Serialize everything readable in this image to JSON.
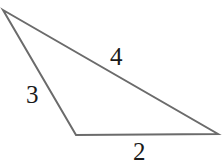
{
  "figure": {
    "kind": "triangle-diagram",
    "background_color": "#ffffff",
    "stroke_color": "#6b6b6b",
    "label_color": "#1a1a1a",
    "stroke_width": 2,
    "canvas": {
      "width": 223,
      "height": 168
    },
    "vertices": [
      {
        "name": "apex-left",
        "x": 3,
        "y": 10
      },
      {
        "name": "vertex-right",
        "x": 218,
        "y": 134
      },
      {
        "name": "vertex-bottom",
        "x": 76,
        "y": 135
      }
    ],
    "polygon_points": "3,10 218,134 76,135",
    "sides": [
      {
        "name": "side-top",
        "label": "4",
        "from": "apex-left",
        "to": "vertex-right"
      },
      {
        "name": "side-left",
        "label": "3",
        "from": "apex-left",
        "to": "vertex-bottom"
      },
      {
        "name": "side-bottom",
        "label": "2",
        "from": "vertex-bottom",
        "to": "vertex-right"
      }
    ],
    "labels": {
      "top": "4",
      "left": "3",
      "bottom": "2"
    }
  }
}
